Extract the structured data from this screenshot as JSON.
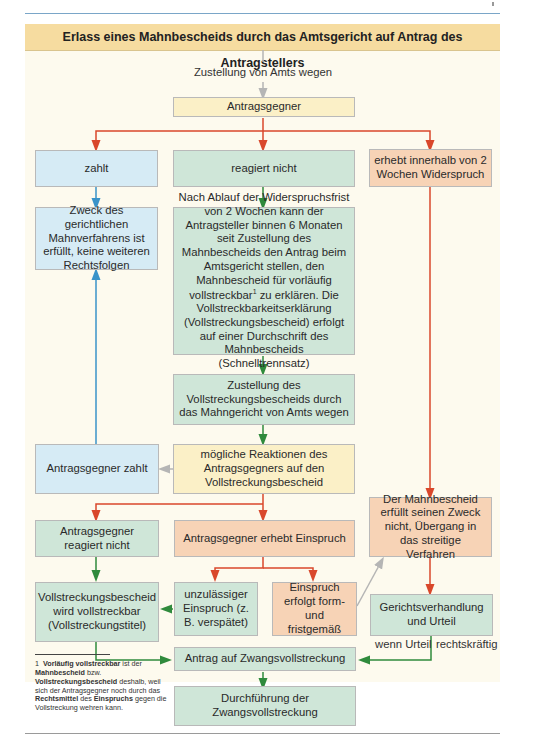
{
  "header": {
    "title": "Erlass eines Mahnbescheids durch das Amtsgericht auf Antrag des Antragstellers"
  },
  "labels": {
    "zustellung": "Zustellung von Amts wegen",
    "wenn_urteil": "wenn Urteil",
    "rechtskraeftig": "rechtskräftig"
  },
  "nodes": {
    "antragsgegner": "Antragsgegner",
    "zahlt": "zahlt",
    "reagiert_nicht": "reagiert nicht",
    "widerspruch": "erhebt innerhalb von 2 Wochen Widerspruch",
    "zweck_erfuellt": "Zweck des gerichtlichen Mahnverfahrens ist erfüllt, keine weiteren Rechtsfolgen",
    "nach_ablauf": "Nach Ablauf der Widerspruchsfrist von 2 Wochen kann der Antragsteller binnen 6 Monaten seit Zustellung des Mahnbescheids den Antrag beim Amtsgericht stellen, den Mahnbescheid für vorläufig vollstreckbar",
    "nach_ablauf_sup": "1",
    "nach_ablauf_rest": " zu erklären. Die Vollstreckbarkeitserklärung (Vollstreckungsbescheid) erfolgt auf einer Durchschrift des Mahnbescheids (Schnelltrennsatz)",
    "zustellung_vb": "Zustellung des Vollstreckungsbescheids durch das Mahngericht von Amts wegen",
    "antragsgegner_zahlt": "Antragsgegner zahlt",
    "moegliche_reaktionen": "mögliche Reaktionen des Antragsgegners auf den Vollstreckungsbescheid",
    "zweck_nicht_erfuellt": "Der Mahnbescheid erfüllt seinen Zweck nicht, Übergang in das streitige Verfahren",
    "ag_reagiert_nicht": "Antragsgegner reagiert nicht",
    "ag_erhebt_einspruch": "Antragsgegner erhebt Einspruch",
    "vb_vollstreckbar": "Vollstreckungsbescheid wird vollstreckbar (Vollstreckungstitel)",
    "unzulaessig": "unzulässiger Einspruch (z. B. verspätet)",
    "einspruch_form": "Einspruch erfolgt form- und fristgemäß",
    "gerichtsverhandlung": "Gerichtsverhandlung und Urteil",
    "antrag_zwang": "Antrag auf Zwangsvollstreckung",
    "durchfuehrung": "Durchführung der Zwangsvollstreckung"
  },
  "footnote": {
    "number": "1",
    "b1": "Vorläufig vollstreckbar",
    "t1": " ist der ",
    "b2": "Mahnbescheid",
    "t2": " bzw. ",
    "b3": "Vollstreckungsbescheid",
    "t3": " deshalb, weil sich der Antragsgegner noch durch das ",
    "b4": "Rechtsmittel",
    "t4": " des ",
    "b5": "Einspruchs",
    "t5": " gegen die Vollstreckung wehren kann."
  },
  "colors": {
    "header_bg": "#f6dca0",
    "panel_bg": "#fdfaee",
    "blue_box": "#d6ebf5",
    "green_box": "#cfe6d8",
    "yellow_box": "#fbf0c7",
    "orange_box": "#f7d3b6",
    "arrow_red": "#d9472b",
    "arrow_green": "#2f8a3c",
    "arrow_blue": "#3a93c9",
    "arrow_gray": "#b5b5b5"
  }
}
